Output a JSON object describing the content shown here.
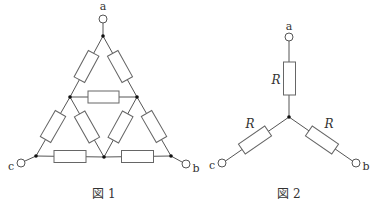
{
  "figures": [
    {
      "id": "fig1",
      "caption": "図 1",
      "terminals": {
        "a": "a",
        "b": "b",
        "c": "c"
      },
      "description": "Triangular network of 9 equal resistors between terminals a, b, c"
    },
    {
      "id": "fig2",
      "caption": "図 2",
      "terminals": {
        "a": "a",
        "b": "b",
        "c": "c"
      },
      "resistor_labels": [
        "R",
        "R",
        "R"
      ],
      "description": "Star (Y) connection of three resistors R"
    }
  ],
  "colors": {
    "wire": "#555555",
    "resistor_outline": "#666666",
    "node": "#111111",
    "text": "#333333"
  }
}
